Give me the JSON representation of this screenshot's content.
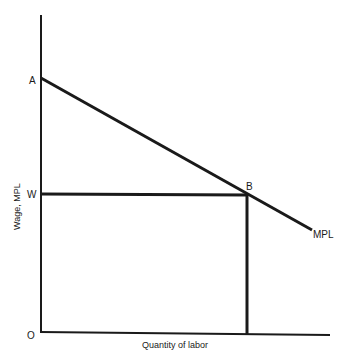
{
  "diagram": {
    "type": "labor-market-mpl",
    "y_axis_label": "Wage, MPL",
    "x_axis_label": "Quantity of labor",
    "points": {
      "origin": "O",
      "intercept": "A",
      "wage": "W",
      "equilibrium": "B"
    },
    "curve_label": "MPL",
    "colors": {
      "line": "#1a1a1a",
      "background": "#ffffff"
    }
  }
}
